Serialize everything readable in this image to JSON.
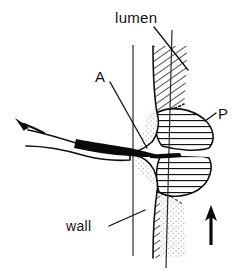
{
  "figure": {
    "kind": "line-art-anatomical-diagram",
    "width": 234,
    "height": 277,
    "background_color": "#ffffff",
    "ink_color": "#111111"
  },
  "labels": {
    "lumen": "lumen",
    "wall": "wall",
    "catheter_tip": "A",
    "plaque": "P"
  },
  "icons": {
    "flow_arrow_left": "arrow-up-left-icon",
    "flow_arrow_bottom": "arrow-up-icon"
  },
  "regions": {
    "vessel_wall_fill": "diagonal-hatch",
    "plaque_fill": "horizontal-hatch",
    "subintimal_fill": "stipple",
    "catheter_fill": "solid-black"
  },
  "colors": {
    "ink": "#111111",
    "hatch": "#1a1a1a",
    "stipple": "#8a8a8a",
    "background": "#ffffff"
  }
}
